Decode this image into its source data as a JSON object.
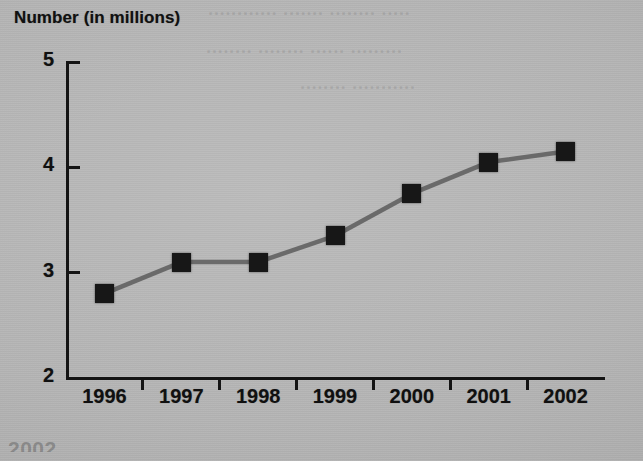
{
  "chart_data": {
    "type": "line",
    "title": "Number (in millions)",
    "xlabel": "",
    "ylabel": "",
    "categories": [
      "1996",
      "1997",
      "1998",
      "1999",
      "2000",
      "2001",
      "2002"
    ],
    "values": [
      2.8,
      3.1,
      3.1,
      3.35,
      3.75,
      4.05,
      4.15
    ],
    "series": [
      {
        "name": "Number (in millions)",
        "values": [
          2.8,
          3.1,
          3.1,
          3.35,
          3.75,
          4.05,
          4.15
        ]
      }
    ],
    "ylim": [
      2,
      5
    ],
    "y_ticks": [
      "2",
      "3",
      "4",
      "5"
    ],
    "y_tick_values": [
      2,
      3,
      4,
      5
    ],
    "grid": false,
    "legend": "none",
    "marker": "square",
    "marker_color": "#171717",
    "line_color": "#6a6a6a",
    "background_color": "#b6b6b6",
    "axis_color": "#141414"
  },
  "figure": {
    "title": "Number (in millions)",
    "ghost_text": {
      "line_1": "............ ....... ........ .....",
      "line_2": "........ ........ ...... .........",
      "line_3": "........ ...........",
      "bottom": "2002"
    }
  }
}
